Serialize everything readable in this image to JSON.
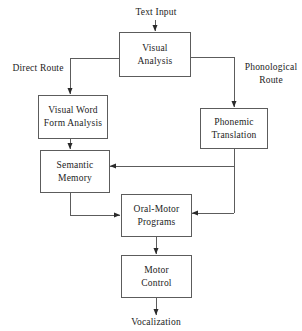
{
  "diagram": {
    "stroke_color": "#5c5c5c",
    "text_color": "#1c1c1c",
    "background_color": "#ffffff",
    "nodes": [
      {
        "id": "visual-analysis",
        "label": "Visual\nAnalysis"
      },
      {
        "id": "visual-word-form-analysis",
        "label": "Visual  Word\nForm  Analysis"
      },
      {
        "id": "phonemic-translation",
        "label": "Phonemic\nTranslation"
      },
      {
        "id": "semantic-memory",
        "label": "Semantic\nMemory"
      },
      {
        "id": "oral-motor-programs",
        "label": "Oral-Motor\nPrograms"
      },
      {
        "id": "motor-control",
        "label": "Motor\nControl"
      }
    ],
    "labels": {
      "text_input": "Text Input",
      "direct_route": "Direct Route",
      "phonological_route": "Phonological\nRoute",
      "vocalization": "Vocalization"
    },
    "edges": [
      {
        "from": "text-input",
        "to": "visual-analysis"
      },
      {
        "from": "visual-analysis",
        "to": "visual-word-form-analysis"
      },
      {
        "from": "visual-analysis",
        "to": "phonemic-translation"
      },
      {
        "from": "visual-word-form-analysis",
        "to": "semantic-memory"
      },
      {
        "from": "phonemic-translation",
        "to": "semantic-memory"
      },
      {
        "from": "phonemic-translation",
        "to": "oral-motor-programs"
      },
      {
        "from": "semantic-memory",
        "to": "oral-motor-programs"
      },
      {
        "from": "oral-motor-programs",
        "to": "motor-control"
      },
      {
        "from": "motor-control",
        "to": "vocalization"
      }
    ]
  }
}
